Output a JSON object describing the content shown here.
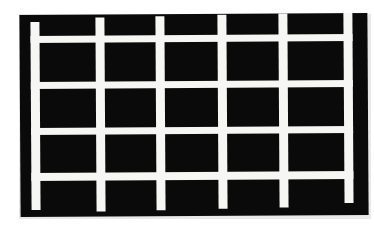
{
  "image": {
    "title": "Black calibration plate with white grid overlay",
    "width": 374,
    "height": 228,
    "background_color": "#ffffff"
  },
  "plate": {
    "name": "black-plate",
    "fill_color": "#0a0a0a",
    "edge_shadow_color": "#e9e9e9",
    "left": 20,
    "top": 14,
    "width": 348,
    "height": 202,
    "rotation_deg": -0.35
  },
  "grid": {
    "line_color": "#f6f6f4",
    "columns": 5,
    "rows": 4,
    "vertical_bar_count": 6,
    "horizontal_bar_count": 5,
    "vertical_bars": [
      {
        "name": "vertical-bar-1",
        "x": 11,
        "y": 7,
        "width": 9,
        "height": 188
      },
      {
        "name": "vertical-bar-2",
        "x": 76,
        "y": 3,
        "width": 9,
        "height": 194
      },
      {
        "name": "vertical-bar-3",
        "x": 136,
        "y": 2,
        "width": 9,
        "height": 194
      },
      {
        "name": "vertical-bar-4",
        "x": 198,
        "y": 1,
        "width": 9,
        "height": 194
      },
      {
        "name": "vertical-bar-5",
        "x": 259,
        "y": 0,
        "width": 9,
        "height": 194
      },
      {
        "name": "vertical-bar-6",
        "x": 324,
        "y": 0,
        "width": 9,
        "height": 190
      }
    ],
    "horizontal_bars": [
      {
        "name": "horizontal-bar-1",
        "x": 11,
        "y": 21,
        "width": 322,
        "height": 7
      },
      {
        "name": "horizontal-bar-2",
        "x": 11,
        "y": 67,
        "width": 322,
        "height": 7
      },
      {
        "name": "horizontal-bar-3",
        "x": 11,
        "y": 113,
        "width": 322,
        "height": 7
      },
      {
        "name": "horizontal-bar-4",
        "x": 11,
        "y": 158,
        "width": 322,
        "height": 8
      },
      {
        "name": "horizontal-bar-5",
        "x": 11,
        "y": 188,
        "width": 322,
        "height": 0
      }
    ]
  }
}
